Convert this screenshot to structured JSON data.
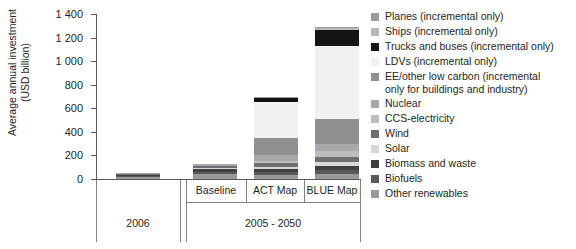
{
  "chart_data": {
    "type": "bar",
    "stacked": true,
    "title": "",
    "xlabel": "",
    "ylabel": "Average annual investment\n(USD billion)",
    "ylim": [
      0,
      1400
    ],
    "yticks": [
      "0",
      "200",
      "400",
      "600",
      "800",
      "1 000",
      "1 200",
      "1 400"
    ],
    "ytick_values": [
      0,
      200,
      400,
      600,
      800,
      1000,
      1200,
      1400
    ],
    "grid": false,
    "legend_position": "right",
    "categories": [
      "2006",
      "Baseline",
      "ACT Map",
      "BLUE Map"
    ],
    "group_labels": [
      {
        "label": "2006",
        "spans": [
          "2006"
        ]
      },
      {
        "label": "2005 - 2050",
        "spans": [
          "Baseline",
          "ACT Map",
          "BLUE Map"
        ]
      }
    ],
    "series": [
      {
        "name": "Planes (incremental only)",
        "color": "#9a9b9e",
        "values": [
          0,
          0,
          7,
          12
        ]
      },
      {
        "name": "Ships (incremental only)",
        "color": "#b6b7b9",
        "values": [
          0,
          0,
          6,
          10
        ]
      },
      {
        "name": "Trucks and buses (incremental only)",
        "color": "#141414",
        "values": [
          0,
          0,
          36,
          140
        ]
      },
      {
        "name": "LDVs (incremental only)",
        "color": "#f1f1f1",
        "values": [
          0,
          0,
          299,
          615
        ]
      },
      {
        "name": "EE/other low carbon (incremental\nonly for buildings and industry)",
        "color": "#8e9092",
        "values": [
          0,
          0,
          150,
          218
        ]
      },
      {
        "name": "Nuclear",
        "color": "#a6a8ab",
        "values": [
          6,
          14,
          48,
          58
        ]
      },
      {
        "name": "CCS-electricity",
        "color": "#bbbdbf",
        "values": [
          0,
          0,
          14,
          52
        ]
      },
      {
        "name": "Wind",
        "color": "#6d6e71",
        "values": [
          6,
          16,
          36,
          42
        ]
      },
      {
        "name": "Solar",
        "color": "#d6d7d8",
        "values": [
          2,
          6,
          20,
          36
        ]
      },
      {
        "name": "Biomass and waste",
        "color": "#3f4042",
        "values": [
          10,
          26,
          28,
          34
        ]
      },
      {
        "name": "Biofuels",
        "color": "#58595b",
        "values": [
          8,
          18,
          22,
          30
        ]
      },
      {
        "name": "Other renewables",
        "color": "#97999b",
        "values": [
          20,
          44,
          34,
          43
        ]
      }
    ],
    "totals": [
      52,
      124,
      700,
      1290
    ]
  },
  "legend": {
    "items": [
      {
        "label": "Planes (incremental only)",
        "color": "#9a9b9e"
      },
      {
        "label": "Ships (incremental only)",
        "color": "#b6b7b9"
      },
      {
        "label": "Trucks and buses (incremental only)",
        "color": "#141414"
      },
      {
        "label": "LDVs (incremental only)",
        "color": "#f1f1f1"
      },
      {
        "label": "EE/other low carbon (incremental\nonly for buildings and industry)",
        "color": "#8e9092"
      },
      {
        "label": "Nuclear",
        "color": "#a6a8ab"
      },
      {
        "label": "CCS-electricity",
        "color": "#bbbdbf"
      },
      {
        "label": "Wind",
        "color": "#6d6e71"
      },
      {
        "label": "Solar",
        "color": "#d6d7d8"
      },
      {
        "label": "Biomass and waste",
        "color": "#3f4042"
      },
      {
        "label": "Biofuels",
        "color": "#58595b"
      },
      {
        "label": "Other renewables",
        "color": "#97999b"
      }
    ]
  },
  "axis": {
    "y_title": "Average annual investment\n(USD billion)"
  }
}
